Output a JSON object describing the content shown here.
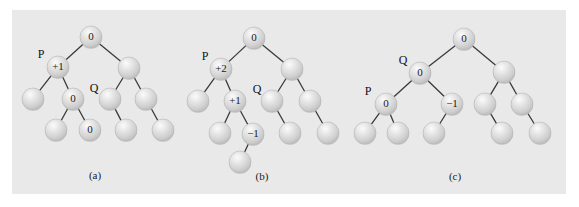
{
  "figure": {
    "background_color": "#ffffff",
    "panel_color": "#e9e9e9",
    "node_fill": "#d6d6d6",
    "node_highlight": "#f4f4f4",
    "edge_color": "#3a3a3a",
    "label_color": "#1a1a1a"
  },
  "captions": {
    "a": "(a)",
    "b": "(b)",
    "c": "(c)"
  },
  "pointers": {
    "a_P": "P",
    "a_Q": "Q",
    "b_P": "P",
    "b_Q": "Q",
    "c_P": "P",
    "c_Q": "Q"
  },
  "trees": [
    {
      "id": "tree-a",
      "caption": "(a)",
      "caption_pos": {
        "x": 95,
        "y": 176
      },
      "nodes": [
        {
          "id": "a-root",
          "x": 91,
          "y": 37,
          "r": 11,
          "label": "0"
        },
        {
          "id": "a-n-p",
          "x": 58,
          "y": 67,
          "r": 11,
          "label": "+1"
        },
        {
          "id": "a-n-l1",
          "x": 33,
          "y": 99,
          "r": 11,
          "label": ""
        },
        {
          "id": "a-n-q",
          "x": 73,
          "y": 99,
          "r": 11,
          "label": "0"
        },
        {
          "id": "a-n-ql",
          "x": 56,
          "y": 130,
          "r": 11,
          "label": ""
        },
        {
          "id": "a-n-qr",
          "x": 90,
          "y": 130,
          "r": 11,
          "label": "0"
        },
        {
          "id": "a-n-r",
          "x": 129,
          "y": 68,
          "r": 11,
          "label": ""
        },
        {
          "id": "a-n-rl",
          "x": 110,
          "y": 99,
          "r": 11,
          "label": ""
        },
        {
          "id": "a-n-rr",
          "x": 146,
          "y": 99,
          "r": 11,
          "label": ""
        },
        {
          "id": "a-n-rll",
          "x": 126,
          "y": 130,
          "r": 11,
          "label": ""
        },
        {
          "id": "a-n-rrr",
          "x": 163,
          "y": 130,
          "r": 11,
          "label": ""
        }
      ],
      "edges": [
        [
          "a-root",
          "a-n-p"
        ],
        [
          "a-root",
          "a-n-r"
        ],
        [
          "a-n-p",
          "a-n-l1"
        ],
        [
          "a-n-p",
          "a-n-q"
        ],
        [
          "a-n-q",
          "a-n-ql"
        ],
        [
          "a-n-q",
          "a-n-qr"
        ],
        [
          "a-n-r",
          "a-n-rl"
        ],
        [
          "a-n-r",
          "a-n-rr"
        ],
        [
          "a-n-rl",
          "a-n-rll"
        ],
        [
          "a-n-rr",
          "a-n-rrr"
        ]
      ],
      "pointers": [
        {
          "text": "P",
          "x": 41,
          "y": 55
        },
        {
          "text": "Q",
          "x": 94,
          "y": 89
        }
      ]
    },
    {
      "id": "tree-b",
      "caption": "(b)",
      "caption_pos": {
        "x": 262,
        "y": 177
      },
      "nodes": [
        {
          "id": "b-root",
          "x": 254,
          "y": 38,
          "r": 11,
          "label": "0"
        },
        {
          "id": "b-n-p",
          "x": 221,
          "y": 69,
          "r": 11,
          "label": "+2"
        },
        {
          "id": "b-n-l1",
          "x": 198,
          "y": 101,
          "r": 11,
          "label": ""
        },
        {
          "id": "b-n-q",
          "x": 235,
          "y": 101,
          "r": 11,
          "label": "+1"
        },
        {
          "id": "b-n-ql",
          "x": 220,
          "y": 133,
          "r": 11,
          "label": ""
        },
        {
          "id": "b-n-qr",
          "x": 253,
          "y": 134,
          "r": 11,
          "label": "-1"
        },
        {
          "id": "b-n-qrl",
          "x": 240,
          "y": 162,
          "r": 11,
          "label": ""
        },
        {
          "id": "b-n-r",
          "x": 292,
          "y": 69,
          "r": 11,
          "label": ""
        },
        {
          "id": "b-n-rl",
          "x": 272,
          "y": 101,
          "r": 11,
          "label": ""
        },
        {
          "id": "b-n-rr",
          "x": 310,
          "y": 101,
          "r": 11,
          "label": ""
        },
        {
          "id": "b-n-rll",
          "x": 290,
          "y": 133,
          "r": 11,
          "label": ""
        },
        {
          "id": "b-n-rrr",
          "x": 328,
          "y": 133,
          "r": 11,
          "label": ""
        }
      ],
      "edges": [
        [
          "b-root",
          "b-n-p"
        ],
        [
          "b-root",
          "b-n-r"
        ],
        [
          "b-n-p",
          "b-n-l1"
        ],
        [
          "b-n-p",
          "b-n-q"
        ],
        [
          "b-n-q",
          "b-n-ql"
        ],
        [
          "b-n-q",
          "b-n-qr"
        ],
        [
          "b-n-qr",
          "b-n-qrl"
        ],
        [
          "b-n-r",
          "b-n-rl"
        ],
        [
          "b-n-r",
          "b-n-rr"
        ],
        [
          "b-n-rl",
          "b-n-rll"
        ],
        [
          "b-n-rr",
          "b-n-rrr"
        ]
      ],
      "pointers": [
        {
          "text": "P",
          "x": 205,
          "y": 57
        },
        {
          "text": "Q",
          "x": 257,
          "y": 90
        }
      ]
    },
    {
      "id": "tree-c",
      "caption": "(c)",
      "caption_pos": {
        "x": 455,
        "y": 177
      },
      "nodes": [
        {
          "id": "c-root",
          "x": 464,
          "y": 39,
          "r": 11,
          "label": "0"
        },
        {
          "id": "c-n-q",
          "x": 420,
          "y": 73,
          "r": 11,
          "label": "0"
        },
        {
          "id": "c-n-p",
          "x": 386,
          "y": 104,
          "r": 11,
          "label": "0"
        },
        {
          "id": "c-n-pl",
          "x": 365,
          "y": 133,
          "r": 11,
          "label": ""
        },
        {
          "id": "c-n-pr",
          "x": 398,
          "y": 133,
          "r": 11,
          "label": ""
        },
        {
          "id": "c-n-qr",
          "x": 452,
          "y": 104,
          "r": 11,
          "label": "-1"
        },
        {
          "id": "c-n-qrl",
          "x": 434,
          "y": 133,
          "r": 11,
          "label": ""
        },
        {
          "id": "c-n-r",
          "x": 504,
          "y": 72,
          "r": 11,
          "label": ""
        },
        {
          "id": "c-n-rl",
          "x": 485,
          "y": 104,
          "r": 11,
          "label": ""
        },
        {
          "id": "c-n-rr",
          "x": 522,
          "y": 104,
          "r": 11,
          "label": ""
        },
        {
          "id": "c-n-rll",
          "x": 502,
          "y": 133,
          "r": 11,
          "label": ""
        },
        {
          "id": "c-n-rrr",
          "x": 540,
          "y": 133,
          "r": 11,
          "label": ""
        }
      ],
      "edges": [
        [
          "c-root",
          "c-n-q"
        ],
        [
          "c-root",
          "c-n-r"
        ],
        [
          "c-n-q",
          "c-n-p"
        ],
        [
          "c-n-q",
          "c-n-qr"
        ],
        [
          "c-n-p",
          "c-n-pl"
        ],
        [
          "c-n-p",
          "c-n-pr"
        ],
        [
          "c-n-qr",
          "c-n-qrl"
        ],
        [
          "c-n-r",
          "c-n-rl"
        ],
        [
          "c-n-r",
          "c-n-rr"
        ],
        [
          "c-n-rl",
          "c-n-rll"
        ],
        [
          "c-n-rr",
          "c-n-rrr"
        ]
      ],
      "pointers": [
        {
          "text": "P",
          "x": 368,
          "y": 92
        },
        {
          "text": "Q",
          "x": 403,
          "y": 61
        }
      ]
    }
  ]
}
